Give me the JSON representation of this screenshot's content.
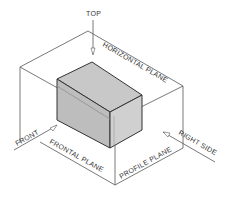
{
  "diagram": {
    "type": "orthographic-projection-planes",
    "labels": {
      "top": "TOP",
      "horizontal_plane": "HORIZONTAL PLANE",
      "front": "FRONT",
      "frontal_plane": "FRONTAL PLANE",
      "profile_plane": "PROFILE PLANE",
      "right_side": "RIGHT SIDE"
    },
    "colors": {
      "block_top": "#c8c8c8",
      "block_front": "#bdbdbd",
      "block_side": "#d0d0d0",
      "lines": "#555555"
    }
  }
}
